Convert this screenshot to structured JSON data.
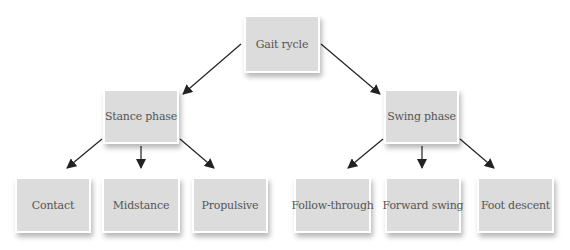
{
  "diagram": {
    "type": "tree",
    "root": {
      "id": "gait-cycle",
      "label": "Gait rycle",
      "box": {
        "x": 244,
        "y": 15,
        "w": 76,
        "h": 58
      }
    },
    "phases": [
      {
        "id": "stance-phase",
        "label": "Stance phase",
        "box": {
          "x": 103,
          "y": 89,
          "w": 76,
          "h": 55
        },
        "children": [
          {
            "id": "contact",
            "label": "Contact",
            "box": {
              "x": 15,
              "y": 177,
              "w": 76,
              "h": 56
            }
          },
          {
            "id": "midstance",
            "label": "Midstance",
            "box": {
              "x": 102,
              "y": 177,
              "w": 78,
              "h": 56
            }
          },
          {
            "id": "propulsive",
            "label": "Propulsive",
            "box": {
              "x": 192,
              "y": 177,
              "w": 76,
              "h": 56
            }
          }
        ]
      },
      {
        "id": "swing-phase",
        "label": "Swing phase",
        "box": {
          "x": 384,
          "y": 89,
          "w": 75,
          "h": 55
        },
        "children": [
          {
            "id": "follow-through",
            "label": "Follow-through",
            "box": {
              "x": 294,
              "y": 177,
              "w": 77,
              "h": 56
            }
          },
          {
            "id": "forward-swing",
            "label": "Forward swing",
            "box": {
              "x": 385,
              "y": 177,
              "w": 76,
              "h": 56
            }
          },
          {
            "id": "foot-descent",
            "label": "Foot descent",
            "box": {
              "x": 477,
              "y": 177,
              "w": 77,
              "h": 56
            }
          }
        ]
      }
    ],
    "edges": [
      {
        "from": "gait-cycle",
        "to": "stance-phase",
        "x1": 241,
        "y1": 44,
        "x2": 183,
        "y2": 94
      },
      {
        "from": "gait-cycle",
        "to": "swing-phase",
        "x1": 321,
        "y1": 44,
        "x2": 380,
        "y2": 94
      },
      {
        "from": "stance-phase",
        "to": "contact",
        "x1": 102,
        "y1": 139,
        "x2": 67,
        "y2": 168
      },
      {
        "from": "stance-phase",
        "to": "midstance",
        "x1": 141,
        "y1": 146,
        "x2": 141,
        "y2": 168
      },
      {
        "from": "stance-phase",
        "to": "propulsive",
        "x1": 180,
        "y1": 139,
        "x2": 214,
        "y2": 168
      },
      {
        "from": "swing-phase",
        "to": "follow-through",
        "x1": 383,
        "y1": 139,
        "x2": 348,
        "y2": 168
      },
      {
        "from": "swing-phase",
        "to": "forward-swing",
        "x1": 422,
        "y1": 146,
        "x2": 422,
        "y2": 168
      },
      {
        "from": "swing-phase",
        "to": "foot-descent",
        "x1": 460,
        "y1": 139,
        "x2": 494,
        "y2": 168
      }
    ],
    "colors": {
      "box_fill": "#dcdcdc",
      "box_border": "#ffffff",
      "text": "#555555",
      "arrow": "#222222",
      "background": "#ffffff"
    }
  }
}
